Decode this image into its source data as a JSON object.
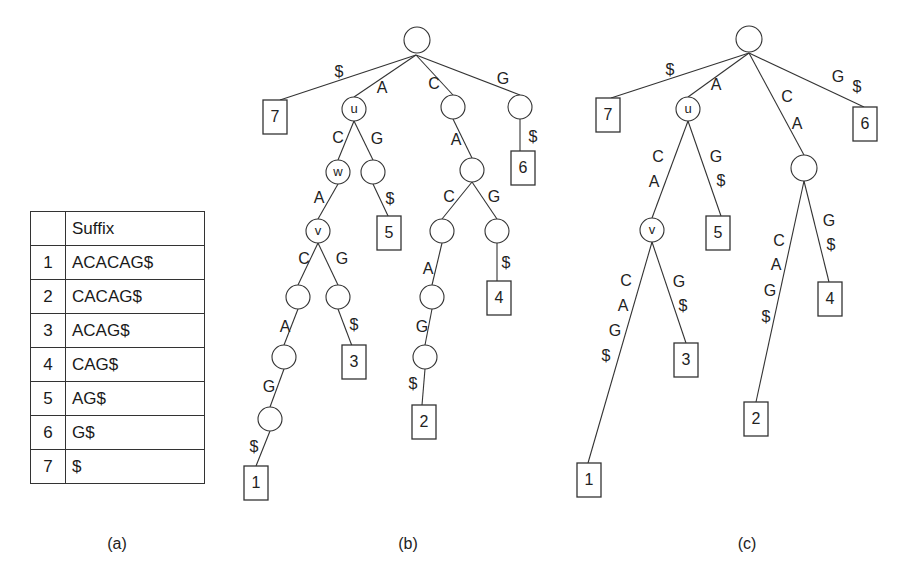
{
  "table": {
    "header": {
      "index": "",
      "suffix": "Suffix"
    },
    "rows": [
      {
        "index": "1",
        "suffix": "ACACAG$"
      },
      {
        "index": "2",
        "suffix": "CACAG$"
      },
      {
        "index": "3",
        "suffix": "ACAG$"
      },
      {
        "index": "4",
        "suffix": "CAG$"
      },
      {
        "index": "5",
        "suffix": "AG$"
      },
      {
        "index": "6",
        "suffix": "G$"
      },
      {
        "index": "7",
        "suffix": "$"
      }
    ]
  },
  "captions": {
    "a": "(a)",
    "b": "(b)",
    "c": "(c)"
  },
  "tree_b": {
    "nodes": [
      {
        "id": "root",
        "type": "circle",
        "x": 417,
        "y": 40,
        "r": 13,
        "label": ""
      },
      {
        "id": "u",
        "type": "circle",
        "x": 354,
        "y": 109,
        "r": 12,
        "label": "u"
      },
      {
        "id": "c1",
        "type": "circle",
        "x": 453,
        "y": 107,
        "r": 12,
        "label": ""
      },
      {
        "id": "g1",
        "type": "circle",
        "x": 520,
        "y": 107,
        "r": 12,
        "label": ""
      },
      {
        "id": "w",
        "type": "circle",
        "x": 338,
        "y": 172,
        "r": 12,
        "label": "w"
      },
      {
        "id": "ug",
        "type": "circle",
        "x": 373,
        "y": 172,
        "r": 12,
        "label": ""
      },
      {
        "id": "ca",
        "type": "circle",
        "x": 472,
        "y": 170,
        "r": 12,
        "label": ""
      },
      {
        "id": "v",
        "type": "circle",
        "x": 318,
        "y": 231,
        "r": 12,
        "label": "v"
      },
      {
        "id": "cac",
        "type": "circle",
        "x": 442,
        "y": 231,
        "r": 12,
        "label": ""
      },
      {
        "id": "cag",
        "type": "circle",
        "x": 497,
        "y": 231,
        "r": 12,
        "label": ""
      },
      {
        "id": "vc",
        "type": "circle",
        "x": 298,
        "y": 297,
        "r": 12,
        "label": ""
      },
      {
        "id": "vg",
        "type": "circle",
        "x": 338,
        "y": 297,
        "r": 12,
        "label": ""
      },
      {
        "id": "caca",
        "type": "circle",
        "x": 432,
        "y": 297,
        "r": 12,
        "label": ""
      },
      {
        "id": "vca",
        "type": "circle",
        "x": 284,
        "y": 357,
        "r": 12,
        "label": ""
      },
      {
        "id": "cacag",
        "type": "circle",
        "x": 425,
        "y": 357,
        "r": 12,
        "label": ""
      },
      {
        "id": "vcag",
        "type": "circle",
        "x": 270,
        "y": 419,
        "r": 12,
        "label": ""
      },
      {
        "id": "L7",
        "type": "box",
        "x": 275,
        "y": 117,
        "w": 24,
        "h": 34,
        "label": "7"
      },
      {
        "id": "L6",
        "type": "box",
        "x": 523,
        "y": 168,
        "w": 24,
        "h": 34,
        "label": "6"
      },
      {
        "id": "L5",
        "type": "box",
        "x": 389,
        "y": 233,
        "w": 24,
        "h": 34,
        "label": "5"
      },
      {
        "id": "L4",
        "type": "box",
        "x": 499,
        "y": 298,
        "w": 24,
        "h": 34,
        "label": "4"
      },
      {
        "id": "L3",
        "type": "box",
        "x": 354,
        "y": 362,
        "w": 24,
        "h": 34,
        "label": "3"
      },
      {
        "id": "L2",
        "type": "box",
        "x": 424,
        "y": 422,
        "w": 24,
        "h": 34,
        "label": "2"
      },
      {
        "id": "L1",
        "type": "box",
        "x": 256,
        "y": 483,
        "w": 24,
        "h": 34,
        "label": "1"
      }
    ],
    "edges": [
      {
        "from": "root",
        "to": "L7",
        "x1": 416,
        "y1": 55,
        "x2": 280,
        "y2": 100,
        "labels": [
          {
            "text": "$",
            "x": 339,
            "y": 73
          }
        ]
      },
      {
        "from": "root",
        "to": "u",
        "x1": 416,
        "y1": 55,
        "x2": 354,
        "y2": 97,
        "labels": [
          {
            "text": "A",
            "x": 382,
            "y": 89
          }
        ]
      },
      {
        "from": "root",
        "to": "c1",
        "x1": 416,
        "y1": 55,
        "x2": 453,
        "y2": 95,
        "labels": [
          {
            "text": "C",
            "x": 434,
            "y": 85
          }
        ]
      },
      {
        "from": "root",
        "to": "g1",
        "x1": 416,
        "y1": 55,
        "x2": 520,
        "y2": 95,
        "labels": [
          {
            "text": "G",
            "x": 503,
            "y": 80
          }
        ]
      },
      {
        "from": "u",
        "to": "w",
        "x1": 354,
        "y1": 121,
        "x2": 338,
        "y2": 160,
        "labels": [
          {
            "text": "C",
            "x": 338,
            "y": 139
          }
        ]
      },
      {
        "from": "u",
        "to": "ug",
        "x1": 354,
        "y1": 121,
        "x2": 373,
        "y2": 160,
        "labels": [
          {
            "text": "G",
            "x": 377,
            "y": 140
          }
        ]
      },
      {
        "from": "c1",
        "to": "ca",
        "x1": 453,
        "y1": 119,
        "x2": 472,
        "y2": 158,
        "labels": [
          {
            "text": "A",
            "x": 456,
            "y": 141
          }
        ]
      },
      {
        "from": "g1",
        "to": "L6",
        "x1": 520,
        "y1": 119,
        "x2": 520,
        "y2": 158,
        "labels": [
          {
            "text": "$",
            "x": 533,
            "y": 138
          }
        ]
      },
      {
        "from": "w",
        "to": "v",
        "x1": 338,
        "y1": 184,
        "x2": 318,
        "y2": 219,
        "labels": [
          {
            "text": "A",
            "x": 319,
            "y": 199
          }
        ]
      },
      {
        "from": "ug",
        "to": "L5",
        "x1": 373,
        "y1": 184,
        "x2": 389,
        "y2": 218,
        "labels": [
          {
            "text": "$",
            "x": 390,
            "y": 200
          }
        ]
      },
      {
        "from": "ca",
        "to": "cac",
        "x1": 472,
        "y1": 182,
        "x2": 442,
        "y2": 219,
        "labels": [
          {
            "text": "C",
            "x": 449,
            "y": 198
          }
        ]
      },
      {
        "from": "ca",
        "to": "cag",
        "x1": 472,
        "y1": 182,
        "x2": 497,
        "y2": 219,
        "labels": [
          {
            "text": "G",
            "x": 494,
            "y": 198
          }
        ]
      },
      {
        "from": "v",
        "to": "vc",
        "x1": 318,
        "y1": 243,
        "x2": 298,
        "y2": 285,
        "labels": [
          {
            "text": "C",
            "x": 304,
            "y": 260
          }
        ]
      },
      {
        "from": "v",
        "to": "vg",
        "x1": 318,
        "y1": 243,
        "x2": 338,
        "y2": 285,
        "labels": [
          {
            "text": "G",
            "x": 342,
            "y": 260
          }
        ]
      },
      {
        "from": "cac",
        "to": "caca",
        "x1": 442,
        "y1": 243,
        "x2": 432,
        "y2": 285,
        "labels": [
          {
            "text": "A",
            "x": 428,
            "y": 270
          }
        ]
      },
      {
        "from": "cag",
        "to": "L4",
        "x1": 497,
        "y1": 243,
        "x2": 497,
        "y2": 284,
        "labels": [
          {
            "text": "$",
            "x": 506,
            "y": 264
          }
        ]
      },
      {
        "from": "vc",
        "to": "vca",
        "x1": 298,
        "y1": 309,
        "x2": 284,
        "y2": 345,
        "labels": [
          {
            "text": "A",
            "x": 285,
            "y": 328
          }
        ]
      },
      {
        "from": "vg",
        "to": "L3",
        "x1": 338,
        "y1": 309,
        "x2": 352,
        "y2": 346,
        "labels": [
          {
            "text": "$",
            "x": 354,
            "y": 326
          }
        ]
      },
      {
        "from": "caca",
        "to": "cacag",
        "x1": 432,
        "y1": 309,
        "x2": 425,
        "y2": 345,
        "labels": [
          {
            "text": "G",
            "x": 422,
            "y": 328
          }
        ]
      },
      {
        "from": "vca",
        "to": "vcag",
        "x1": 284,
        "y1": 369,
        "x2": 270,
        "y2": 407,
        "labels": [
          {
            "text": "G",
            "x": 269,
            "y": 388
          }
        ]
      },
      {
        "from": "cacag",
        "to": "L2",
        "x1": 425,
        "y1": 369,
        "x2": 422,
        "y2": 405,
        "labels": [
          {
            "text": "$",
            "x": 413,
            "y": 385
          }
        ]
      },
      {
        "from": "vcag",
        "to": "L1",
        "x1": 270,
        "y1": 431,
        "x2": 256,
        "y2": 466,
        "labels": [
          {
            "text": "$",
            "x": 254,
            "y": 448
          }
        ]
      }
    ]
  },
  "tree_c": {
    "nodes": [
      {
        "id": "root",
        "type": "circle",
        "x": 749,
        "y": 39,
        "r": 13,
        "label": ""
      },
      {
        "id": "u",
        "type": "circle",
        "x": 688,
        "y": 109,
        "r": 12,
        "label": "u"
      },
      {
        "id": "ca",
        "type": "circle",
        "x": 804,
        "y": 168,
        "r": 13,
        "label": ""
      },
      {
        "id": "v",
        "type": "circle",
        "x": 652,
        "y": 230,
        "r": 12,
        "label": "v"
      },
      {
        "id": "L7",
        "type": "box",
        "x": 608,
        "y": 115,
        "w": 24,
        "h": 34,
        "label": "7"
      },
      {
        "id": "L6",
        "type": "box",
        "x": 865,
        "y": 124,
        "w": 24,
        "h": 34,
        "label": "6"
      },
      {
        "id": "L5",
        "type": "box",
        "x": 718,
        "y": 233,
        "w": 24,
        "h": 34,
        "label": "5"
      },
      {
        "id": "L4",
        "type": "box",
        "x": 830,
        "y": 299,
        "w": 24,
        "h": 34,
        "label": "4"
      },
      {
        "id": "L3",
        "type": "box",
        "x": 686,
        "y": 360,
        "w": 24,
        "h": 34,
        "label": "3"
      },
      {
        "id": "L2",
        "type": "box",
        "x": 756,
        "y": 419,
        "w": 24,
        "h": 34,
        "label": "2"
      },
      {
        "id": "L1",
        "type": "box",
        "x": 589,
        "y": 480,
        "w": 24,
        "h": 34,
        "label": "1"
      }
    ],
    "edges": [
      {
        "from": "root",
        "to": "L7",
        "x1": 749,
        "y1": 53,
        "x2": 611,
        "y2": 98,
        "labels": [
          {
            "text": "$",
            "x": 670,
            "y": 71
          }
        ]
      },
      {
        "from": "root",
        "to": "u",
        "x1": 749,
        "y1": 53,
        "x2": 688,
        "y2": 97,
        "labels": [
          {
            "text": "A",
            "x": 716,
            "y": 86
          }
        ]
      },
      {
        "from": "root",
        "to": "ca",
        "x1": 749,
        "y1": 53,
        "x2": 804,
        "y2": 155,
        "labels": [
          {
            "text": "C",
            "x": 787,
            "y": 98
          },
          {
            "text": "A",
            "x": 797,
            "y": 125
          }
        ]
      },
      {
        "from": "root",
        "to": "L6",
        "x1": 749,
        "y1": 53,
        "x2": 864,
        "y2": 107,
        "labels": [
          {
            "text": "G",
            "x": 838,
            "y": 78
          },
          {
            "text": "$",
            "x": 857,
            "y": 88
          }
        ]
      },
      {
        "from": "u",
        "to": "v",
        "x1": 688,
        "y1": 121,
        "x2": 652,
        "y2": 218,
        "labels": [
          {
            "text": "C",
            "x": 658,
            "y": 158
          },
          {
            "text": "A",
            "x": 654,
            "y": 183
          }
        ]
      },
      {
        "from": "u",
        "to": "L5",
        "x1": 688,
        "y1": 121,
        "x2": 721,
        "y2": 216,
        "labels": [
          {
            "text": "G",
            "x": 716,
            "y": 158
          },
          {
            "text": "$",
            "x": 721,
            "y": 182
          }
        ]
      },
      {
        "from": "ca",
        "to": "L2",
        "x1": 804,
        "y1": 181,
        "x2": 756,
        "y2": 402,
        "labels": [
          {
            "text": "C",
            "x": 779,
            "y": 242
          },
          {
            "text": "A",
            "x": 776,
            "y": 266
          },
          {
            "text": "G",
            "x": 770,
            "y": 292
          },
          {
            "text": "$",
            "x": 766,
            "y": 318
          }
        ]
      },
      {
        "from": "ca",
        "to": "L4",
        "x1": 804,
        "y1": 181,
        "x2": 829,
        "y2": 282,
        "labels": [
          {
            "text": "G",
            "x": 829,
            "y": 222
          },
          {
            "text": "$",
            "x": 831,
            "y": 246
          }
        ]
      },
      {
        "from": "v",
        "to": "L1",
        "x1": 652,
        "y1": 242,
        "x2": 588,
        "y2": 463,
        "labels": [
          {
            "text": "C",
            "x": 626,
            "y": 282
          },
          {
            "text": "A",
            "x": 623,
            "y": 307
          },
          {
            "text": "G",
            "x": 615,
            "y": 332
          },
          {
            "text": "$",
            "x": 606,
            "y": 357
          }
        ]
      },
      {
        "from": "v",
        "to": "L3",
        "x1": 652,
        "y1": 242,
        "x2": 686,
        "y2": 343,
        "labels": [
          {
            "text": "G",
            "x": 679,
            "y": 283
          },
          {
            "text": "$",
            "x": 683,
            "y": 307
          }
        ]
      }
    ]
  },
  "caption_positions": {
    "a": {
      "x": 117,
      "y": 545
    },
    "b": {
      "x": 408,
      "y": 545
    },
    "c": {
      "x": 747,
      "y": 545
    }
  }
}
